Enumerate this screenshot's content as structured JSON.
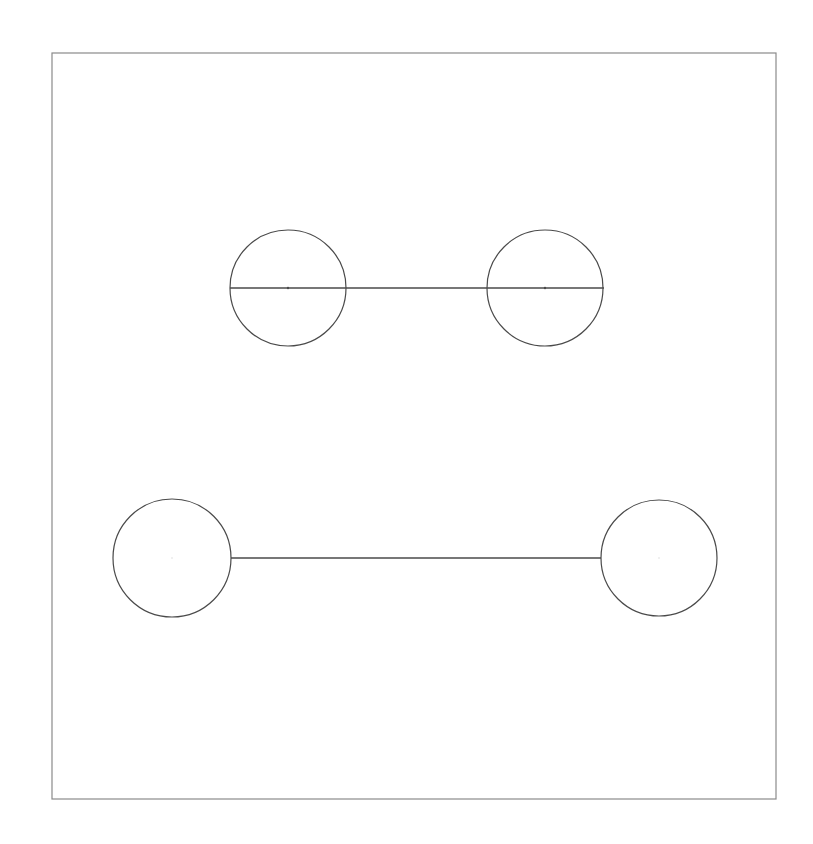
{
  "diagram": {
    "background": "#ffffff",
    "stroke_color": "#4a4a4a",
    "frame": {
      "x": 52,
      "y": 53,
      "width": 724,
      "height": 746,
      "stroke": "#8a8a8a"
    },
    "groups": [
      {
        "name": "top-pair",
        "circles": [
          {
            "cx": 288,
            "cy": 288,
            "r": 58
          },
          {
            "cx": 545,
            "cy": 288,
            "r": 58
          }
        ],
        "line": {
          "x1": 230,
          "y1": 288,
          "x2": 604,
          "y2": 288
        },
        "center_dots": true
      },
      {
        "name": "bottom-pair",
        "circles": [
          {
            "cx": 172,
            "cy": 558,
            "r": 59
          },
          {
            "cx": 659,
            "cy": 558,
            "r": 58
          }
        ],
        "line": {
          "x1": 231,
          "y1": 558,
          "x2": 601,
          "y2": 558
        },
        "center_dots": false
      }
    ]
  }
}
